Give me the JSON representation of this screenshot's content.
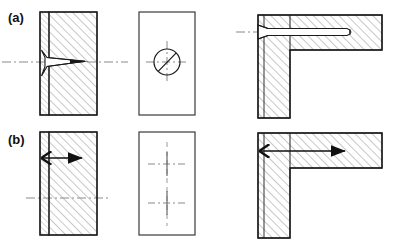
{
  "figure": {
    "type": "engineering-cross-section-diagram",
    "width": 397,
    "height": 247,
    "background": "#ffffff",
    "line_color": "#1a1a1a",
    "hatch_color": "#9a9a9a",
    "centerline_color": "#8a8a8a",
    "rows": [
      {
        "id": "row-a",
        "label": "(a)",
        "description": "conical cavity / drilled feature",
        "views": [
          {
            "id": "a-section",
            "name": "left-section-view",
            "feature": "wedge-cavity",
            "hatched": true,
            "centerline": "horizontal"
          },
          {
            "id": "a-face",
            "name": "middle-face-view",
            "feature": "circle-with-diagonal",
            "hatched": false,
            "centerline": "cross"
          },
          {
            "id": "a-corner",
            "name": "right-corner-section-view",
            "feature": "horizontal-bore-with-countersink",
            "hatched": true,
            "centerline": "horizontal"
          }
        ]
      },
      {
        "id": "row-b",
        "label": "(b)",
        "description": "straight through feature / arrow path",
        "views": [
          {
            "id": "b-section",
            "name": "left-section-view",
            "feature": "straight-arrow",
            "hatched": true,
            "centerline": "horizontal"
          },
          {
            "id": "b-face",
            "name": "middle-face-view",
            "feature": "two-crosshair-marks",
            "hatched": false,
            "centerline": "vertical-dashed"
          },
          {
            "id": "b-corner",
            "name": "right-corner-section-view",
            "feature": "straight-arrow-through-corner",
            "hatched": true,
            "centerline": "none"
          }
        ]
      }
    ]
  },
  "labels": {
    "a": "(a)",
    "b": "(b)"
  }
}
